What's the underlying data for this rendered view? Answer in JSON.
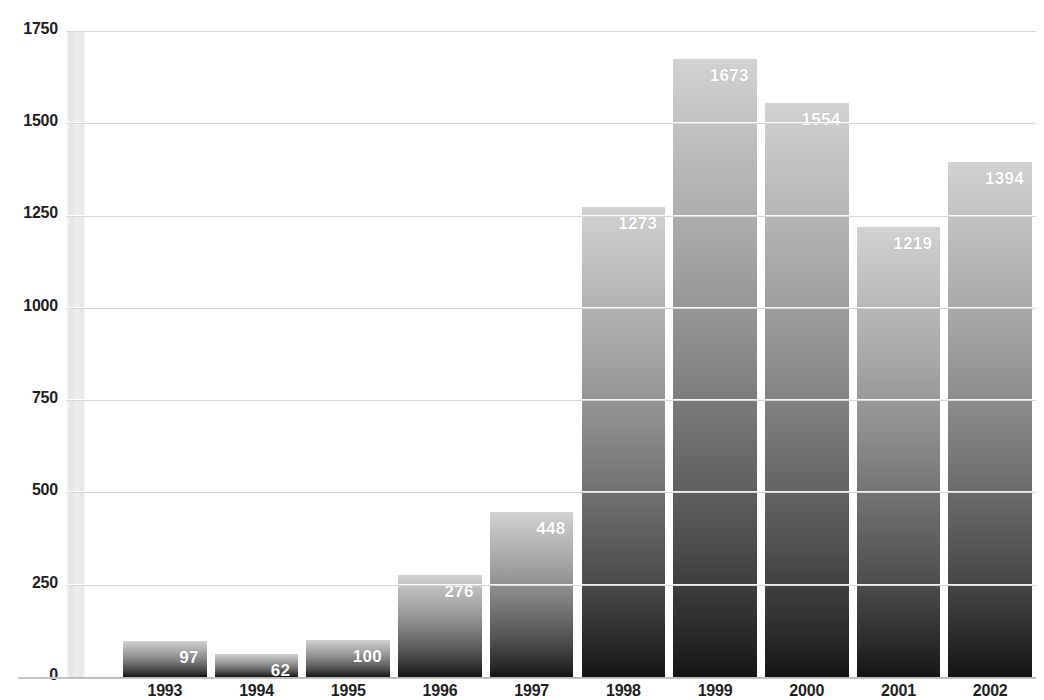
{
  "chart": {
    "title": "",
    "title_clipped": true
  },
  "chart_data": {
    "type": "bar",
    "title": "",
    "xlabel": "",
    "ylabel": "",
    "ylim": [
      0,
      1750
    ],
    "yticks": [
      0,
      250,
      500,
      750,
      1000,
      1250,
      1500,
      1750
    ],
    "ytick_labels": [
      "0",
      "250",
      "500",
      "750",
      "1000",
      "1250",
      "1500",
      "1750"
    ],
    "grid": true,
    "legend": null,
    "categories": [
      "1993",
      "1994",
      "1995",
      "1996",
      "1997",
      "1998",
      "1999",
      "2000",
      "2001",
      "2002"
    ],
    "values": [
      97,
      62,
      100,
      276,
      448,
      1273,
      1673,
      1554,
      1219,
      1394
    ],
    "data_labels": [
      "97",
      "62",
      "100",
      "276",
      "448",
      "1273",
      "1673",
      "1554",
      "1219",
      "1394"
    ],
    "bar_fill": "#8d8d8d",
    "bar_gradient_top": "#d2d2d2",
    "bar_gradient_bottom": "#141414",
    "label_color": "#ffffff",
    "gridline_color": "#d8d8d8",
    "axis_color": "#c4c4c4",
    "text_color": "#1f1f1f"
  }
}
